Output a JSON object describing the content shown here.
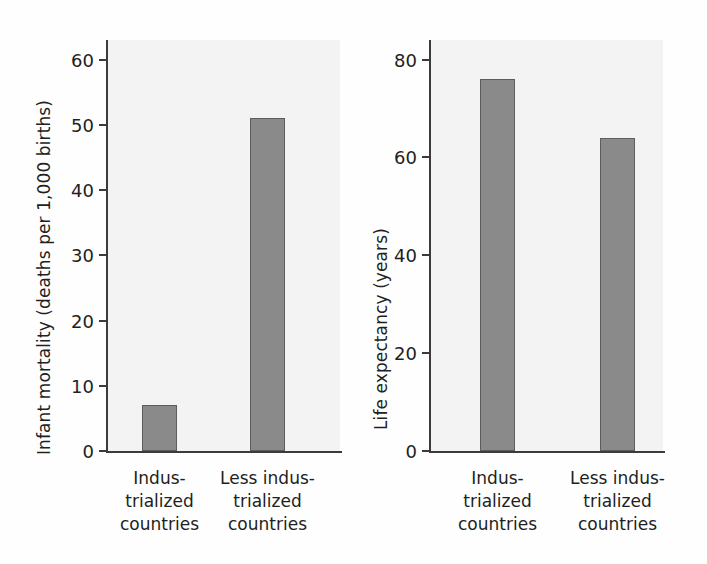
{
  "figure": {
    "background_color": "#fefefe",
    "plot_background_color": "#f3f3f3",
    "bar_color": "#8a8a8a",
    "bar_edge_color": "#5d5d5d",
    "axis_color": "#3b3b3b",
    "text_color": "#231f20"
  },
  "chart_data": [
    {
      "type": "bar",
      "id": "infant-mortality",
      "title": "",
      "xlabel": "",
      "ylabel": "Infant mortality (deaths per 1,000 births)",
      "categories": [
        "Indus-\ntrialized\ncountries",
        "Less indus-\ntrialized\ncountries"
      ],
      "values": [
        7,
        51
      ],
      "ylim": [
        0,
        63
      ],
      "yticks": [
        0,
        10,
        20,
        30,
        40,
        50,
        60
      ],
      "ytick_labels": [
        "0",
        "10",
        "20",
        "30",
        "40",
        "50",
        "60"
      ],
      "grid": false,
      "legend": "none"
    },
    {
      "type": "bar",
      "id": "life-expectancy",
      "title": "",
      "xlabel": "",
      "ylabel": "Life expectancy (years)",
      "categories": [
        "Indus-\ntrialized\ncountries",
        "Less indus-\ntrialized\ncountries"
      ],
      "values": [
        76,
        64
      ],
      "ylim": [
        0,
        84
      ],
      "yticks": [
        0,
        20,
        40,
        60,
        80
      ],
      "ytick_labels": [
        "0",
        "20",
        "40",
        "60",
        "80"
      ],
      "grid": false,
      "legend": "none"
    }
  ]
}
